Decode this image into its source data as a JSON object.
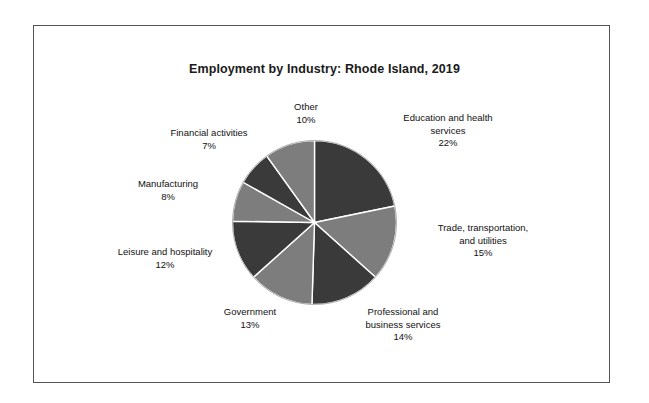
{
  "figure": {
    "background_color": "#ffffff",
    "frame_color": "#555555"
  },
  "chart_data": {
    "type": "pie",
    "title": "Employment by Industry: Rhode Island, 2019",
    "xlabel": "",
    "ylabel": "",
    "units": "percent",
    "start_angle_deg": 0,
    "direction": "clockwise",
    "legend": "none",
    "grid": false,
    "labels_on_slices": false,
    "colors": {
      "dark": "#3a3a3a",
      "light": "#7d7d7d",
      "separator": "#ffffff"
    },
    "categories": [
      "Education and health services",
      "Trade, transportation, and utilities",
      "Professional and business services",
      "Government",
      "Leisure and hospitality",
      "Manufacturing",
      "Financial activities",
      "Other"
    ],
    "values": [
      22,
      15,
      14,
      13,
      12,
      8,
      7,
      10
    ],
    "slices": [
      {
        "name": "Education and health services",
        "label_line_1": "Education and health",
        "label_line_2": "services",
        "percent_text": "22%",
        "value": 22,
        "color": "#3a3a3a",
        "shade": "dark"
      },
      {
        "name": "Trade, transportation, and utilities",
        "label_line_1": "Trade, transportation,",
        "label_line_2": "and utilities",
        "percent_text": "15%",
        "value": 15,
        "color": "#7d7d7d",
        "shade": "light"
      },
      {
        "name": "Professional and business services",
        "label_line_1": "Professional and",
        "label_line_2": "business services",
        "percent_text": "14%",
        "value": 14,
        "color": "#3a3a3a",
        "shade": "dark"
      },
      {
        "name": "Government",
        "label_line_1": "Government",
        "label_line_2": "",
        "percent_text": "13%",
        "value": 13,
        "color": "#7d7d7d",
        "shade": "light"
      },
      {
        "name": "Leisure and hospitality",
        "label_line_1": "Leisure and hospitality",
        "label_line_2": "",
        "percent_text": "12%",
        "value": 12,
        "color": "#3a3a3a",
        "shade": "dark"
      },
      {
        "name": "Manufacturing",
        "label_line_1": "Manufacturing",
        "label_line_2": "",
        "percent_text": "8%",
        "value": 8,
        "color": "#7d7d7d",
        "shade": "light"
      },
      {
        "name": "Financial activities",
        "label_line_1": "Financial activities",
        "label_line_2": "",
        "percent_text": "7%",
        "value": 7,
        "color": "#3a3a3a",
        "shade": "dark"
      },
      {
        "name": "Other",
        "label_line_1": "Other",
        "label_line_2": "",
        "percent_text": "10%",
        "value": 10,
        "color": "#7d7d7d",
        "shade": "light"
      }
    ]
  }
}
